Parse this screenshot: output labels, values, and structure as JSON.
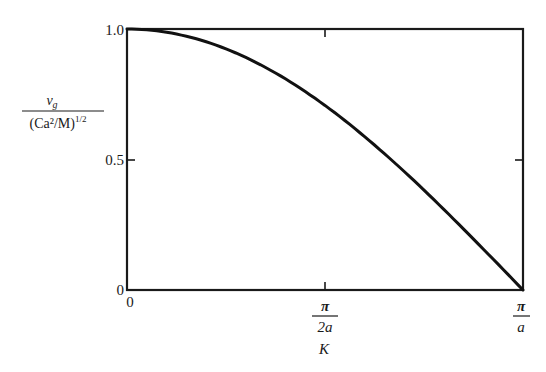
{
  "chart_data": {
    "type": "line",
    "title": "",
    "xlabel": "K",
    "ylabel_numerator": "v_g",
    "ylabel_denominator": "(Ca²/M)^(1/2)",
    "xlim": [
      0,
      "π/a"
    ],
    "ylim": [
      0,
      1.0
    ],
    "grid": false,
    "legend": null,
    "x_ticks": [
      {
        "label": "0",
        "value": 0
      },
      {
        "label_num": "π",
        "label_den": "2a",
        "value": 0.5
      },
      {
        "label_num": "π",
        "label_den": "a",
        "value": 1.0
      }
    ],
    "y_ticks": [
      {
        "label": "0",
        "value": 0
      },
      {
        "label": "0.5",
        "value": 0.5
      },
      {
        "label": "1.0",
        "value": 1.0
      }
    ],
    "series": [
      {
        "name": "v_g / (Ca²/M)^(1/2) = cos(Ka/2)",
        "x_fraction_of_pi_over_a": [
          0,
          0.1,
          0.2,
          0.3,
          0.4,
          0.5,
          0.6,
          0.7,
          0.8,
          0.9,
          1.0
        ],
        "values": [
          1.0,
          0.988,
          0.951,
          0.891,
          0.809,
          0.707,
          0.588,
          0.454,
          0.309,
          0.156,
          0.0
        ]
      }
    ]
  },
  "labels": {
    "y_tick_1": "1.0",
    "y_tick_05": "0.5",
    "y_tick_0": "0",
    "x_tick_0": "0",
    "x_tick_mid_num": "π",
    "x_tick_mid_den": "2a",
    "x_tick_end_num": "π",
    "x_tick_end_den": "a",
    "x_axis_label": "K",
    "y_label_num": "v",
    "y_label_num_sub": "g",
    "y_label_den": "(Ca²/M)",
    "y_label_den_sup": "1/2"
  }
}
